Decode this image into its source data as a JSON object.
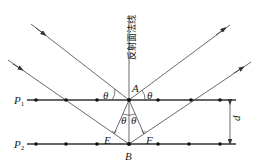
{
  "diagram": {
    "normal_label": "反射面法线",
    "planes": [
      {
        "name": "P",
        "sub": "1",
        "y": 100
      },
      {
        "name": "P",
        "sub": "2",
        "y": 144
      }
    ],
    "points": {
      "A": "A",
      "B": "B",
      "E": "E",
      "F": "F"
    },
    "angle_label": "θ",
    "spacing_label": "d",
    "atom_x": [
      36,
      66,
      97,
      129,
      158,
      191,
      220
    ],
    "colors": {
      "line": "#333333",
      "dot": "#111111",
      "background": "#ffffff"
    }
  }
}
